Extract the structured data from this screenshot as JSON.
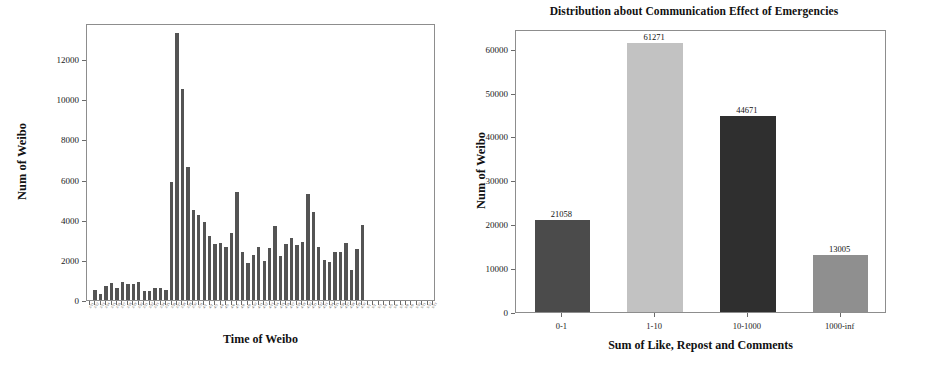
{
  "figure": {
    "background": "#ffffff",
    "panels": 2
  },
  "chart_data": [
    {
      "id": "weibo-time-series",
      "type": "bar",
      "title": "",
      "xlabel": "Time of Weibo",
      "ylabel": "Num of Weibo",
      "ylim": [
        0,
        13800
      ],
      "ytick_labels": [
        "0",
        "2000",
        "4000",
        "6000",
        "8000",
        "10000",
        "12000"
      ],
      "ytick_values": [
        0,
        2000,
        4000,
        6000,
        8000,
        10000,
        12000
      ],
      "grid": false,
      "legend": "none",
      "bar_color": "#545454",
      "categories": [
        "3/11",
        "3/12",
        "3/13",
        "3/14",
        "3/15",
        "3/16",
        "3/17",
        "3/18",
        "3/19",
        "3/20",
        "3/21",
        "3/22",
        "3/23",
        "3/24",
        "3/25",
        "3/26",
        "3/27",
        "3/28",
        "3/29",
        "3/30",
        "3/31",
        "4/1",
        "4/2",
        "4/3",
        "4/4",
        "4/5",
        "4/6",
        "4/7",
        "4/8",
        "4/9",
        "4/10",
        "4/11",
        "4/12",
        "4/13",
        "4/14",
        "4/15",
        "4/16",
        "4/17",
        "4/18",
        "4/19",
        "4/20",
        "4/21",
        "4/22",
        "4/23",
        "4/24",
        "4/25",
        "4/26",
        "4/27",
        "4/28",
        "4/29",
        "4/30",
        "5/1",
        "5/2",
        "5/3",
        "5/4",
        "5/5",
        "5/6",
        "5/7",
        "5/8",
        "5/9",
        "5/10",
        "5/11",
        "5/12",
        "5/13"
      ],
      "values": [
        0,
        520,
        320,
        700,
        840,
        580,
        880,
        810,
        790,
        900,
        430,
        430,
        600,
        620,
        520,
        5900,
        13300,
        10500,
        6650,
        4500,
        4250,
        3880,
        3200,
        2790,
        2830,
        2650,
        3330,
        5400,
        2390,
        1850,
        2230,
        2630,
        1930,
        2600,
        3680,
        2210,
        2780,
        3090,
        2740,
        2900,
        5270,
        4400,
        2640,
        1980,
        1900,
        2390,
        2380,
        2860,
        1520,
        2560,
        3760,
        0,
        0,
        0,
        0,
        0,
        0,
        0,
        0,
        0,
        0,
        0,
        0,
        0
      ]
    },
    {
      "id": "communication-effect-distribution",
      "type": "bar",
      "title": "Distribution about Communication Effect of Emergencies",
      "xlabel": "Sum of Like, Repost and Comments",
      "ylabel": "Num of Weibo",
      "ylim": [
        0,
        64500
      ],
      "ytick_labels": [
        "0",
        "10000",
        "20000",
        "30000",
        "40000",
        "50000",
        "60000"
      ],
      "ytick_values": [
        0,
        10000,
        20000,
        30000,
        40000,
        50000,
        60000
      ],
      "grid": false,
      "legend": "none",
      "categories": [
        "0-1",
        "1-10",
        "10-1000",
        "1000-inf"
      ],
      "values": [
        21058,
        61271,
        44671,
        13005
      ],
      "value_labels": [
        "21058",
        "61271",
        "44671",
        "13005"
      ],
      "bar_colors": [
        "#4b4b4b",
        "#c2c2c2",
        "#2f2f2f",
        "#8f8f8f"
      ]
    }
  ]
}
